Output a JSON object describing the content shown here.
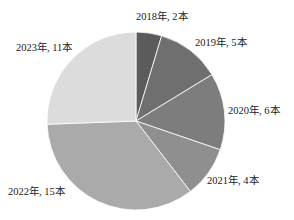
{
  "chart_data": {
    "type": "pie",
    "title": "",
    "categories": [
      "2018年",
      "2019年",
      "2020年",
      "2021年",
      "2022年",
      "2023年"
    ],
    "values": [
      2,
      5,
      6,
      4,
      15,
      11
    ],
    "unit": "本",
    "labels": [
      "2018年, 2本",
      "2019年, 5本",
      "2020年, 6本",
      "2021年, 4本",
      "2022年, 15本",
      "2023年, 11本"
    ],
    "colors": [
      "#5b5b5b",
      "#6f6f6f",
      "#7d7d7d",
      "#8f8f8f",
      "#aaaaaa",
      "#dcdcdc"
    ],
    "start_angle": "12 o'clock",
    "direction": "clockwise",
    "legend": "none (data labels outside slices)"
  },
  "labels": {
    "l2018": "2018年, 2本",
    "l2019": "2019年, 5本",
    "l2020": "2020年, 6本",
    "l2021": "2021年, 4本",
    "l2022": "2022年, 15本",
    "l2023": "2023年, 11本"
  }
}
